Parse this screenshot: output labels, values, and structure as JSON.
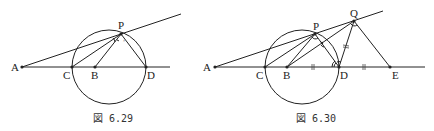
{
  "figures": [
    {
      "id": "left",
      "caption": "図 6.29",
      "points": {
        "A": {
          "label": "A",
          "x": 22,
          "y": 67
        },
        "C": {
          "label": "C",
          "x": 72,
          "y": 67
        },
        "B": {
          "label": "B",
          "x": 95,
          "y": 67
        },
        "D": {
          "label": "D",
          "x": 146,
          "y": 67
        },
        "P": {
          "label": "P",
          "x": 121,
          "y": 34
        }
      },
      "circle": {
        "cx": 109,
        "cy": 67,
        "r": 37
      }
    },
    {
      "id": "right",
      "caption": "図 6.30",
      "points": {
        "A": {
          "label": "A",
          "x": 215,
          "y": 67
        },
        "C": {
          "label": "C",
          "x": 265,
          "y": 67
        },
        "B": {
          "label": "B",
          "x": 287,
          "y": 67
        },
        "D": {
          "label": "D",
          "x": 339,
          "y": 67
        },
        "E": {
          "label": "E",
          "x": 390,
          "y": 67
        },
        "P": {
          "label": "P",
          "x": 315,
          "y": 34
        },
        "Q": {
          "label": "Q",
          "x": 354,
          "y": 21
        }
      },
      "circle": {
        "cx": 302,
        "cy": 67,
        "r": 37
      },
      "equal_marks": [
        "BD",
        "DE",
        "DQ"
      ]
    }
  ]
}
